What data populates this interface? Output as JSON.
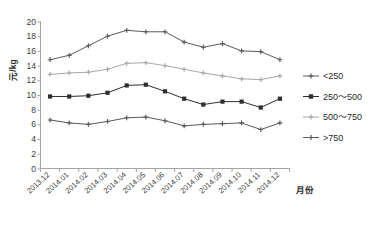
{
  "chart_data": {
    "type": "line",
    "title": "",
    "xlabel": "月份",
    "ylabel": "元/kg",
    "ylim": [
      0,
      20
    ],
    "ytick_step": 2,
    "yticks": [
      0,
      2,
      4,
      6,
      8,
      10,
      12,
      14,
      16,
      18,
      20
    ],
    "grid": false,
    "legend_position": "right",
    "categories": [
      "2013.12",
      "2014.01",
      "2014.02",
      "2014.03",
      "2014.04",
      "2014.05",
      "2014.06",
      "2014.07",
      "2014.08",
      "2014.09",
      "2014.10",
      "2014.11",
      "2014.12"
    ],
    "series": [
      {
        "name": "<250",
        "color": "#59595b",
        "marker": "plus",
        "values": [
          6.6,
          6.2,
          6.0,
          6.4,
          6.9,
          7.0,
          6.5,
          5.8,
          6.0,
          6.1,
          6.2,
          5.3,
          6.2
        ]
      },
      {
        "name": "250～500",
        "color": "#2e2e30",
        "marker": "square",
        "values": [
          9.8,
          9.8,
          9.9,
          10.3,
          11.3,
          11.4,
          10.5,
          9.5,
          8.7,
          9.1,
          9.1,
          8.3,
          9.5
        ]
      },
      {
        "name": "500～750",
        "color": "#a8a8a8",
        "marker": "plus",
        "values": [
          12.8,
          13.0,
          13.1,
          13.5,
          14.3,
          14.4,
          14.0,
          13.5,
          13.0,
          12.6,
          12.2,
          12.1,
          12.6
        ]
      },
      {
        "name": ">750",
        "color": "#5a5a5c",
        "marker": "plus",
        "values": [
          14.8,
          15.4,
          16.7,
          18.0,
          18.8,
          18.6,
          18.6,
          17.2,
          16.5,
          17.0,
          16.0,
          15.9,
          14.8
        ]
      }
    ]
  },
  "legend": {
    "items": [
      {
        "label": "<250"
      },
      {
        "label": "250～500"
      },
      {
        "label": "500～750"
      },
      {
        "label": ">750"
      }
    ]
  },
  "axes": {
    "y_title": "元/kg",
    "x_title": "月份"
  }
}
